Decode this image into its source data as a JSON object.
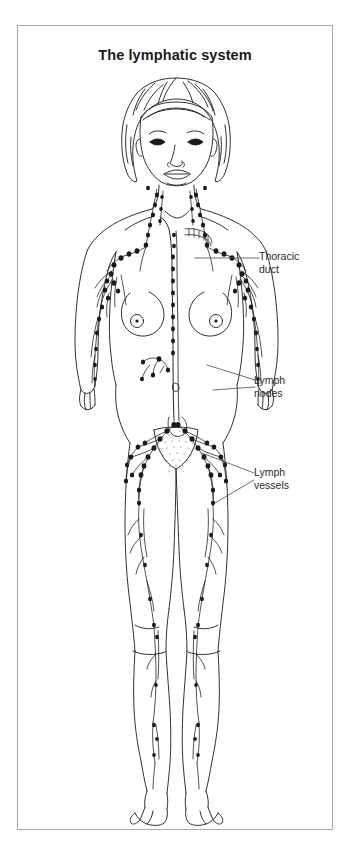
{
  "figure": {
    "title": "The lymphatic system",
    "background_color": "#ffffff",
    "frame_color": "#a8a8a8",
    "ink_color": "#1a1a1a",
    "title_color": "#1a1a1a"
  },
  "callouts": [
    {
      "id": "thoracic-duct",
      "label": "Thoracic\nduct",
      "line1": "Thoracic",
      "line2": "duct",
      "leader": "single-horizontal"
    },
    {
      "id": "lymph-nodes",
      "label": "Lymph\nnodes",
      "line1": "Lymph",
      "line2": "nodes",
      "leader": "forked"
    },
    {
      "id": "lymph-vessels",
      "label": "Lymph\nvessels",
      "line1": "Lymph",
      "line2": "vessels",
      "leader": "forked"
    }
  ]
}
